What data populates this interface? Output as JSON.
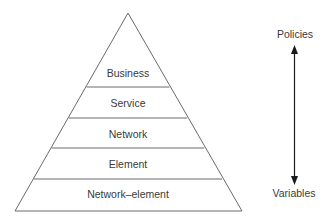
{
  "pyramid": {
    "layers": [
      {
        "label": "Business"
      },
      {
        "label": "Service"
      },
      {
        "label": "Network"
      },
      {
        "label": "Element"
      },
      {
        "label": "Network–element"
      }
    ]
  },
  "axis": {
    "top_label": "Policies",
    "bottom_label": "Variables",
    "direction": "bidirectional"
  },
  "colors": {
    "line": "#5a5a5a",
    "text": "#3a3a3a",
    "arrow": "#1a1a1a",
    "background": "#ffffff"
  }
}
